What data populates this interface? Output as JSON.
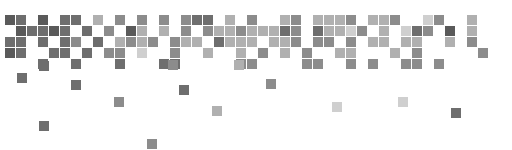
{
  "graphic": {
    "name": "pixel-mosaic-banner",
    "palette": {
      "dark": "#5a5a5a",
      "darkmid": "#6e6e6e",
      "mid": "#8c8c8c",
      "light": "#b0b0b0",
      "faint": "#cfcfcf"
    },
    "grid": {
      "origin_x": 5,
      "origin_y": 15,
      "pitch": 11,
      "size": 10
    },
    "rows": [
      {
        "row": 0,
        "cells": [
          [
            0,
            "dark"
          ],
          [
            1,
            "darkmid"
          ],
          [
            3,
            "dark"
          ],
          [
            5,
            "darkmid"
          ],
          [
            6,
            "darkmid"
          ],
          [
            8,
            "light"
          ],
          [
            10,
            "mid"
          ],
          [
            12,
            "mid"
          ],
          [
            14,
            "mid"
          ],
          [
            16,
            "mid"
          ],
          [
            17,
            "darkmid"
          ],
          [
            18,
            "darkmid"
          ],
          [
            20,
            "light"
          ],
          [
            22,
            "mid"
          ],
          [
            25,
            "light"
          ],
          [
            26,
            "mid"
          ],
          [
            28,
            "light"
          ],
          [
            29,
            "light"
          ],
          [
            30,
            "light"
          ],
          [
            31,
            "mid"
          ],
          [
            33,
            "light"
          ],
          [
            34,
            "light"
          ],
          [
            35,
            "mid"
          ],
          [
            38,
            "faint"
          ],
          [
            39,
            "mid"
          ],
          [
            42,
            "light"
          ]
        ]
      },
      {
        "row": 1,
        "cells": [
          [
            1,
            "dark"
          ],
          [
            2,
            "darkmid"
          ],
          [
            3,
            "darkmid"
          ],
          [
            4,
            "dark"
          ],
          [
            5,
            "darkmid"
          ],
          [
            7,
            "darkmid"
          ],
          [
            9,
            "mid"
          ],
          [
            11,
            "dark"
          ],
          [
            12,
            "light"
          ],
          [
            14,
            "light"
          ],
          [
            16,
            "mid"
          ],
          [
            18,
            "mid"
          ],
          [
            19,
            "light"
          ],
          [
            20,
            "light"
          ],
          [
            21,
            "mid"
          ],
          [
            22,
            "light"
          ],
          [
            23,
            "light"
          ],
          [
            24,
            "light"
          ],
          [
            25,
            "darkmid"
          ],
          [
            26,
            "mid"
          ],
          [
            28,
            "darkmid"
          ],
          [
            29,
            "light"
          ],
          [
            30,
            "light"
          ],
          [
            31,
            "faint"
          ],
          [
            32,
            "mid"
          ],
          [
            34,
            "light"
          ],
          [
            36,
            "faint"
          ],
          [
            37,
            "darkmid"
          ],
          [
            38,
            "mid"
          ],
          [
            40,
            "dark"
          ],
          [
            42,
            "light"
          ]
        ]
      },
      {
        "row": 2,
        "cells": [
          [
            0,
            "darkmid"
          ],
          [
            1,
            "darkmid"
          ],
          [
            3,
            "darkmid"
          ],
          [
            5,
            "darkmid"
          ],
          [
            6,
            "mid"
          ],
          [
            8,
            "darkmid"
          ],
          [
            10,
            "light"
          ],
          [
            11,
            "mid"
          ],
          [
            12,
            "light"
          ],
          [
            13,
            "mid"
          ],
          [
            15,
            "mid"
          ],
          [
            16,
            "light"
          ],
          [
            17,
            "light"
          ],
          [
            19,
            "darkmid"
          ],
          [
            20,
            "light"
          ],
          [
            21,
            "light"
          ],
          [
            22,
            "light"
          ],
          [
            24,
            "light"
          ],
          [
            25,
            "light"
          ],
          [
            26,
            "mid"
          ],
          [
            28,
            "mid"
          ],
          [
            29,
            "mid"
          ],
          [
            31,
            "mid"
          ],
          [
            33,
            "light"
          ],
          [
            34,
            "light"
          ],
          [
            36,
            "light"
          ],
          [
            37,
            "light"
          ],
          [
            40,
            "light"
          ],
          [
            42,
            "mid"
          ]
        ]
      },
      {
        "row": 3,
        "cells": [
          [
            0,
            "dark"
          ],
          [
            1,
            "darkmid"
          ],
          [
            4,
            "darkmid"
          ],
          [
            5,
            "darkmid"
          ],
          [
            7,
            "darkmid"
          ],
          [
            9,
            "mid"
          ],
          [
            10,
            "mid"
          ],
          [
            12,
            "faint"
          ],
          [
            15,
            "mid"
          ],
          [
            18,
            "light"
          ],
          [
            21,
            "light"
          ],
          [
            23,
            "mid"
          ],
          [
            25,
            "light"
          ],
          [
            27,
            "mid"
          ],
          [
            30,
            "light"
          ],
          [
            31,
            "light"
          ],
          [
            35,
            "light"
          ],
          [
            37,
            "mid"
          ],
          [
            43,
            "mid"
          ]
        ]
      },
      {
        "row": 4,
        "cells": [
          [
            3,
            "darkmid"
          ],
          [
            6,
            "darkmid"
          ],
          [
            10,
            "darkmid"
          ],
          [
            14,
            "darkmid"
          ],
          [
            15,
            "darkmid"
          ],
          [
            21,
            "mid"
          ],
          [
            22,
            "mid"
          ],
          [
            27,
            "mid"
          ],
          [
            28,
            "mid"
          ],
          [
            31,
            "mid"
          ],
          [
            33,
            "mid"
          ],
          [
            36,
            "mid"
          ],
          [
            37,
            "mid"
          ],
          [
            39,
            "mid"
          ]
        ]
      }
    ],
    "scattered": [
      {
        "x": 17,
        "y": 73,
        "tone": "darkmid"
      },
      {
        "x": 39,
        "y": 61,
        "tone": "darkmid"
      },
      {
        "x": 71,
        "y": 80,
        "tone": "darkmid"
      },
      {
        "x": 114,
        "y": 97,
        "tone": "mid"
      },
      {
        "x": 168,
        "y": 60,
        "tone": "mid"
      },
      {
        "x": 179,
        "y": 85,
        "tone": "darkmid"
      },
      {
        "x": 212,
        "y": 106,
        "tone": "light"
      },
      {
        "x": 234,
        "y": 60,
        "tone": "light"
      },
      {
        "x": 266,
        "y": 79,
        "tone": "mid"
      },
      {
        "x": 332,
        "y": 102,
        "tone": "faint"
      },
      {
        "x": 398,
        "y": 97,
        "tone": "faint"
      },
      {
        "x": 451,
        "y": 108,
        "tone": "darkmid"
      },
      {
        "x": 39,
        "y": 121,
        "tone": "darkmid"
      },
      {
        "x": 147,
        "y": 139,
        "tone": "mid"
      }
    ]
  }
}
